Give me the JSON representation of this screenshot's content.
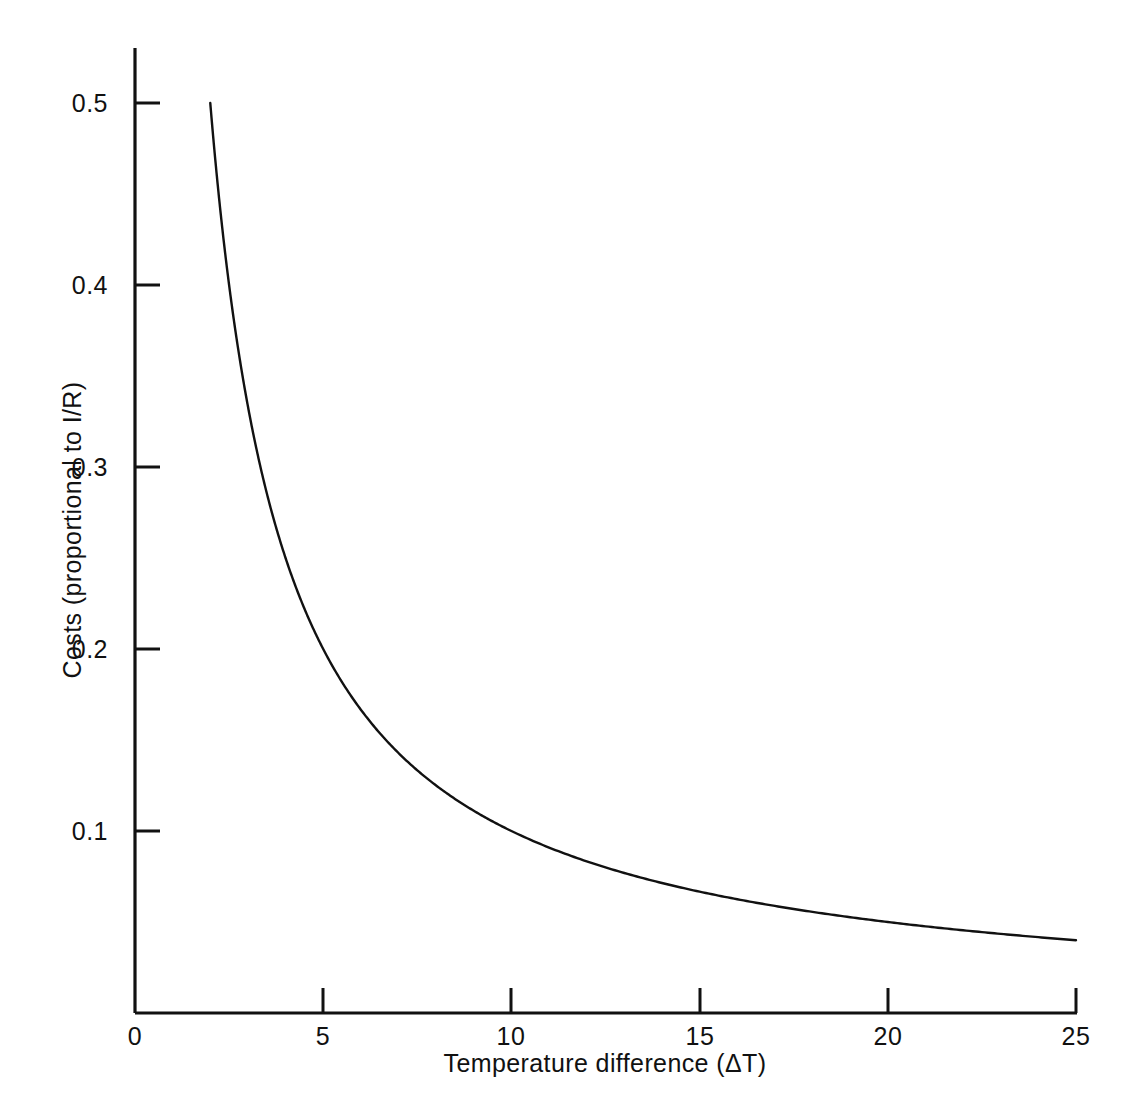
{
  "chart_data": {
    "type": "line",
    "title": "",
    "subtitle": "",
    "xlabel": "Temperature difference (ΔT)",
    "ylabel": "Costs (proportional to I/R)",
    "xlim": [
      0,
      25
    ],
    "ylim": [
      0,
      0.55
    ],
    "xticks": [
      0,
      5,
      10,
      15,
      20,
      25
    ],
    "xtick_labels": [
      "0",
      "5",
      "10",
      "15",
      "20",
      "25"
    ],
    "yticks": [
      0.1,
      0.2,
      0.3,
      0.4,
      0.5
    ],
    "ytick_labels": [
      "0.1",
      "0.2",
      "0.3",
      "0.4",
      "0.5"
    ],
    "grid": false,
    "legend": null,
    "tick_direction": "in",
    "relation": "y = 1 / x",
    "line_color": "#111111",
    "line_width": 2.4,
    "background_color": "#ffffff",
    "series": [
      {
        "name": "Costs",
        "x": [
          2.0,
          2.1,
          2.2,
          2.3,
          2.4,
          2.5,
          2.6,
          2.7,
          2.8,
          2.9,
          3.0,
          3.2,
          3.4,
          3.6,
          3.8,
          4.0,
          4.25,
          4.5,
          4.75,
          5.0,
          5.5,
          6.0,
          6.5,
          7.0,
          7.5,
          8.0,
          8.5,
          9.0,
          9.5,
          10.0,
          11.0,
          12.0,
          13.0,
          14.0,
          15.0,
          16.0,
          17.0,
          18.0,
          19.0,
          20.0,
          21.0,
          22.0,
          23.0,
          24.0,
          25.0
        ],
        "y": [
          0.5,
          0.476,
          0.455,
          0.435,
          0.417,
          0.4,
          0.385,
          0.37,
          0.357,
          0.345,
          0.333,
          0.313,
          0.294,
          0.278,
          0.263,
          0.25,
          0.235,
          0.222,
          0.211,
          0.2,
          0.182,
          0.167,
          0.154,
          0.143,
          0.133,
          0.125,
          0.118,
          0.111,
          0.105,
          0.1,
          0.091,
          0.083,
          0.077,
          0.071,
          0.067,
          0.063,
          0.059,
          0.056,
          0.053,
          0.05,
          0.048,
          0.045,
          0.043,
          0.042,
          0.04
        ]
      }
    ],
    "annotations": []
  },
  "axes": {
    "x_title": "Temperature difference (ΔT)",
    "y_title": "Costs (proportional to I/R)"
  },
  "ticks": {
    "x": [
      {
        "label": "0"
      },
      {
        "label": "5"
      },
      {
        "label": "10"
      },
      {
        "label": "15"
      },
      {
        "label": "20"
      },
      {
        "label": "25"
      }
    ],
    "y": [
      {
        "label": "0.1"
      },
      {
        "label": "0.2"
      },
      {
        "label": "0.3"
      },
      {
        "label": "0.4"
      },
      {
        "label": "0.5"
      }
    ]
  }
}
